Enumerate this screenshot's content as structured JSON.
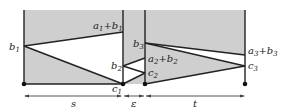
{
  "diagram": {
    "colors": {
      "fill": "#cfcfcf",
      "line": "#222222",
      "background": "#ffffff"
    },
    "labels": {
      "b1": {
        "base": "b",
        "sub": "1"
      },
      "a1b1": {
        "a": "a",
        "a_sub": "1",
        "plus": "+",
        "b": "b",
        "b_sub": "1"
      },
      "b2": {
        "base": "b",
        "sub": "2"
      },
      "c1": {
        "base": "c",
        "sub": "1"
      },
      "b3": {
        "base": "b",
        "sub": "3"
      },
      "a2b2": {
        "a": "a",
        "a_sub": "2",
        "plus": "+",
        "b": "b",
        "b_sub": "2"
      },
      "c2": {
        "base": "c",
        "sub": "2"
      },
      "a3b3": {
        "a": "a",
        "a_sub": "3",
        "plus": "+",
        "b": "b",
        "b_sub": "3"
      },
      "c3": {
        "base": "c",
        "sub": "3"
      }
    },
    "intervals": {
      "s": "s",
      "epsilon": "ε",
      "t": "t"
    }
  }
}
